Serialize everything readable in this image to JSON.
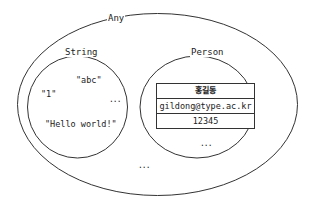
{
  "diagram": {
    "type": "set-venn",
    "any": {
      "label": "Any",
      "ellipsis": "..."
    },
    "string": {
      "label": "String",
      "values": [
        "\"abc\"",
        "\"1\"",
        "\"Hello world!\""
      ],
      "ellipsis": "..."
    },
    "person": {
      "label": "Person",
      "record": {
        "name": "홍길동",
        "email": "gildong@type.ac.kr",
        "id": "12345"
      },
      "ellipsis": "..."
    },
    "colors": {
      "stroke": "#333333",
      "background": "#ffffff",
      "text": "#222222"
    }
  }
}
